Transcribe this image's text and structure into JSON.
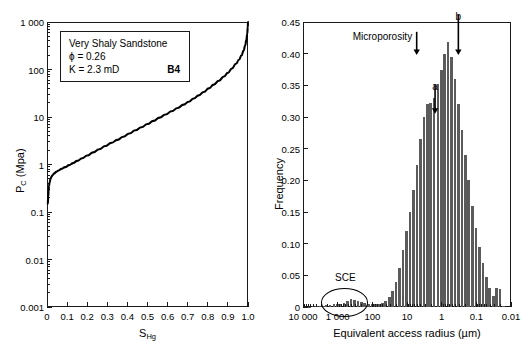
{
  "figure": {
    "panels": [
      "capillary-pressure-curve",
      "pore-size-distribution"
    ]
  },
  "left_panel": {
    "info_box": {
      "title": "Very Shaly Sandstone",
      "porosity": "ϕ = 0.26",
      "permeability": "K = 2.3 mD",
      "sample_id": "B4"
    }
  },
  "right_panel": {
    "annotations": {
      "microporosity_label": "Microporosity",
      "marker_a": "a",
      "marker_b": "b",
      "sce_label": "SCE"
    }
  },
  "chart_data": [
    {
      "id": "capillary-pressure-curve",
      "type": "line",
      "title": "",
      "xlabel": "S_Hg",
      "xlabel_base": "S",
      "xlabel_sub": "Hg",
      "ylabel": "P_C (Mpa)",
      "ylabel_base": "P",
      "ylabel_sub": "C",
      "ylabel_unit": " (Mpa)",
      "xlim": [
        0,
        1.0
      ],
      "ylim": [
        0.001,
        1000
      ],
      "yscale": "log",
      "xscale": "linear",
      "grid": false,
      "xticks": [
        0,
        0.1,
        0.2,
        0.3,
        0.4,
        0.5,
        0.6,
        0.7,
        0.8,
        0.9,
        1.0
      ],
      "xticklabels": [
        "0",
        "0.1",
        "0.2",
        "0.3",
        "0.4",
        "0.5",
        "0.6",
        "0.7",
        "0.8",
        "0.9",
        "1.0"
      ],
      "yticks": [
        1000,
        100,
        10,
        1,
        0.1,
        0.01,
        0.001
      ],
      "yticklabels": [
        "1 000",
        "100",
        "10",
        "1",
        "0.1",
        "0.01",
        "0.001"
      ],
      "series": [
        {
          "name": "Pc vs SHg",
          "color": "#000000",
          "points": [
            [
              0.004,
              0.15
            ],
            [
              0.006,
              0.21
            ],
            [
              0.008,
              0.28
            ],
            [
              0.01,
              0.35
            ],
            [
              0.013,
              0.42
            ],
            [
              0.017,
              0.49
            ],
            [
              0.022,
              0.55
            ],
            [
              0.028,
              0.6
            ],
            [
              0.036,
              0.65
            ],
            [
              0.046,
              0.7
            ],
            [
              0.058,
              0.75
            ],
            [
              0.072,
              0.81
            ],
            [
              0.09,
              0.88
            ],
            [
              0.11,
              0.97
            ],
            [
              0.13,
              1.07
            ],
            [
              0.15,
              1.19
            ],
            [
              0.175,
              1.35
            ],
            [
              0.2,
              1.55
            ],
            [
              0.23,
              1.8
            ],
            [
              0.26,
              2.1
            ],
            [
              0.29,
              2.45
            ],
            [
              0.32,
              2.85
            ],
            [
              0.35,
              3.3
            ],
            [
              0.38,
              3.85
            ],
            [
              0.41,
              4.5
            ],
            [
              0.44,
              5.25
            ],
            [
              0.47,
              6.1
            ],
            [
              0.5,
              7.1
            ],
            [
              0.53,
              8.3
            ],
            [
              0.56,
              9.7
            ],
            [
              0.59,
              11.3
            ],
            [
              0.62,
              13.2
            ],
            [
              0.65,
              15.5
            ],
            [
              0.68,
              18.2
            ],
            [
              0.705,
              21.0
            ],
            [
              0.73,
              24.5
            ],
            [
              0.755,
              28.5
            ],
            [
              0.78,
              33.5
            ],
            [
              0.805,
              40.0
            ],
            [
              0.83,
              48.0
            ],
            [
              0.855,
              58.0
            ],
            [
              0.88,
              71.0
            ],
            [
              0.9,
              85.0
            ],
            [
              0.92,
              105.0
            ],
            [
              0.94,
              132.0
            ],
            [
              0.955,
              160.0
            ],
            [
              0.968,
              200.0
            ],
            [
              0.978,
              250.0
            ],
            [
              0.986,
              320.0
            ],
            [
              0.992,
              420.0
            ],
            [
              0.996,
              560.0
            ],
            [
              0.999,
              780.0
            ],
            [
              1.0,
              1000.0
            ]
          ]
        }
      ]
    },
    {
      "id": "pore-size-distribution",
      "type": "bar",
      "title": "",
      "xlabel": "Equivalent access radius (µm)",
      "ylabel": "Frequency",
      "xscale": "log-reversed",
      "xlim": [
        10000,
        0.01
      ],
      "ylim": [
        0,
        0.45
      ],
      "grid": false,
      "yticks": [
        0,
        0.05,
        0.1,
        0.15,
        0.2,
        0.25,
        0.3,
        0.35,
        0.4,
        0.45
      ],
      "yticklabels": [
        "0",
        "0.05",
        "0.10",
        "0.15",
        "0.20",
        "0.25",
        "0.30",
        "0.35",
        "0.40",
        "0.45"
      ],
      "xticks": [
        10000,
        1000,
        100,
        10,
        1,
        0.1,
        0.01
      ],
      "xticklabels": [
        "10 000",
        "1 000",
        "100",
        "10",
        "1",
        "0.1",
        "0.01"
      ],
      "bar_color": "#5b5b5b",
      "annotations": [
        {
          "name": "microporosity",
          "text": "Microporosity",
          "x": 6.0,
          "y": 0.425
        },
        {
          "name": "marker-a",
          "text": "a",
          "x": 1.55,
          "y": 0.345
        },
        {
          "name": "marker-b",
          "text": "b",
          "x": 0.33,
          "y": 0.455
        },
        {
          "name": "sce",
          "text": "SCE",
          "x": 600,
          "y": 0.042
        }
      ],
      "radii": [
        8000,
        6300,
        5000,
        4000,
        3150,
        2500,
        2000,
        1600,
        1250,
        1000,
        800,
        630,
        500,
        400,
        315,
        250,
        200,
        160,
        125,
        100,
        80,
        63,
        50,
        40,
        31.5,
        25,
        20,
        16,
        12.5,
        10,
        8,
        6.3,
        5,
        4,
        3.15,
        2.5,
        2,
        1.6,
        1.25,
        1.0,
        0.8,
        0.63,
        0.5,
        0.4,
        0.315,
        0.25,
        0.2,
        0.16,
        0.125,
        0.1,
        0.08,
        0.063,
        0.05,
        0.04,
        0.0315,
        0.025,
        0.02,
        0.016
      ],
      "values": [
        0.0,
        0.0,
        0.001,
        0.001,
        0.002,
        0.002,
        0.003,
        0.003,
        0.004,
        0.005,
        0.005,
        0.007,
        0.009,
        0.012,
        0.011,
        0.009,
        0.008,
        0.006,
        0.005,
        0.004,
        0.004,
        0.005,
        0.007,
        0.01,
        0.016,
        0.025,
        0.04,
        0.062,
        0.09,
        0.12,
        0.15,
        0.185,
        0.225,
        0.265,
        0.3,
        0.32,
        0.322,
        0.33,
        0.352,
        0.375,
        0.4,
        0.418,
        0.395,
        0.36,
        0.32,
        0.28,
        0.24,
        0.2,
        0.16,
        0.125,
        0.095,
        0.07,
        0.048,
        0.03,
        0.018,
        0.03,
        0.028,
        0.002
      ]
    }
  ]
}
